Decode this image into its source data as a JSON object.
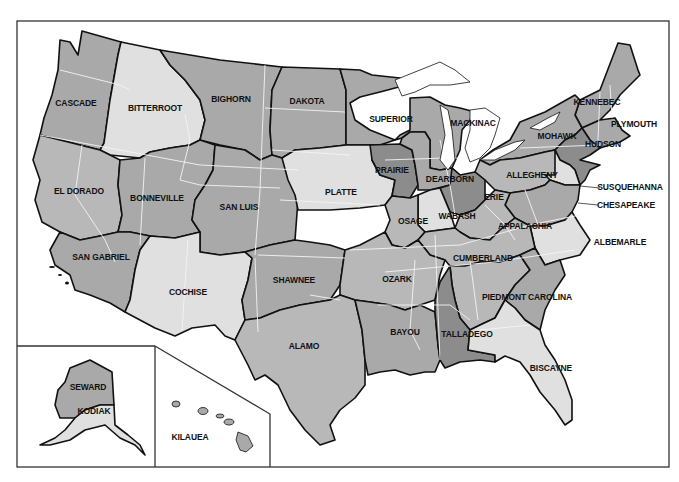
{
  "map": {
    "title": "",
    "shades": {
      "light": "#e0e0e0",
      "medium": "#a9a9a9",
      "mid": "#b8b8b8",
      "dark": "#8c8c8c",
      "border": "#111111",
      "state_line": "#f4f4f4"
    },
    "regions": [
      {
        "id": "cascade",
        "label": "CASCADE",
        "shade": "medium"
      },
      {
        "id": "bitterroot",
        "label": "BITTERROOT",
        "shade": "light"
      },
      {
        "id": "bighorn",
        "label": "BIGHORN",
        "shade": "medium"
      },
      {
        "id": "dakota",
        "label": "DAKOTA",
        "shade": "medium"
      },
      {
        "id": "superior",
        "label": "SUPERIOR",
        "shade": "medium"
      },
      {
        "id": "mackinac",
        "label": "MACKINAC",
        "shade": "medium"
      },
      {
        "id": "kennebec",
        "label": "KENNEBEC",
        "shade": "medium"
      },
      {
        "id": "plymouth",
        "label": "PLYMOUTH",
        "shade": "medium"
      },
      {
        "id": "mohawk",
        "label": "MOHAWK",
        "shade": "medium"
      },
      {
        "id": "hudson",
        "label": "HUDSON",
        "shade": "dark"
      },
      {
        "id": "el-dorado",
        "label": "EL DORADO",
        "shade": "mid"
      },
      {
        "id": "bonneville",
        "label": "BONNEVILLE",
        "shade": "medium"
      },
      {
        "id": "san-luis",
        "label": "SAN LUIS",
        "shade": "medium"
      },
      {
        "id": "platte",
        "label": "PLATTE",
        "shade": "light"
      },
      {
        "id": "prairie",
        "label": "PRAIRIE",
        "shade": "dark"
      },
      {
        "id": "dearborn",
        "label": "DEARBORN",
        "shade": "medium"
      },
      {
        "id": "allegheny",
        "label": "ALLEGHENY",
        "shade": "mid"
      },
      {
        "id": "susquehanna",
        "label": "SUSQUEHANNA",
        "shade": "light"
      },
      {
        "id": "chesapeake",
        "label": "CHESAPEAKE",
        "shade": "medium"
      },
      {
        "id": "erie",
        "label": "ERIE",
        "shade": "dark"
      },
      {
        "id": "wabash",
        "label": "WABASH",
        "shade": "light"
      },
      {
        "id": "osage",
        "label": "OSAGE",
        "shade": "mid"
      },
      {
        "id": "appalachia",
        "label": "APPALACHIA",
        "shade": "mid"
      },
      {
        "id": "albemarle",
        "label": "ALBEMARLE",
        "shade": "light"
      },
      {
        "id": "cumberland",
        "label": "CUMBERLAND",
        "shade": "mid"
      },
      {
        "id": "san-gabriel",
        "label": "SAN GABRIEL",
        "shade": "medium"
      },
      {
        "id": "cochise",
        "label": "COCHISE",
        "shade": "light"
      },
      {
        "id": "shawnee",
        "label": "SHAWNEE",
        "shade": "medium"
      },
      {
        "id": "ozark",
        "label": "OZARK",
        "shade": "mid"
      },
      {
        "id": "piedmont",
        "label": "PIEDMONT",
        "shade": "mid"
      },
      {
        "id": "carolina",
        "label": "CAROLINA",
        "shade": "medium"
      },
      {
        "id": "alamo",
        "label": "ALAMO",
        "shade": "mid"
      },
      {
        "id": "bayou",
        "label": "BAYOU",
        "shade": "medium"
      },
      {
        "id": "talladego",
        "label": "TALLADEGO",
        "shade": "dark"
      },
      {
        "id": "biscayne",
        "label": "BISCAYNE",
        "shade": "light"
      },
      {
        "id": "seward",
        "label": "SEWARD",
        "shade": "medium"
      },
      {
        "id": "kodiak",
        "label": "KODIAK",
        "shade": "light"
      },
      {
        "id": "kilauea",
        "label": "KILAUEA",
        "shade": "medium"
      }
    ]
  }
}
